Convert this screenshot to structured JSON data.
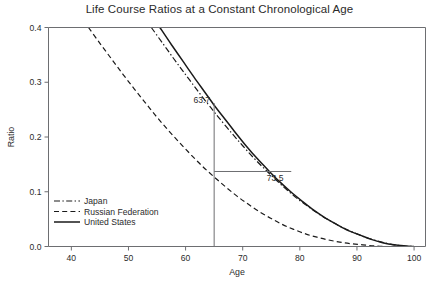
{
  "chart_data": {
    "type": "line",
    "title": "Life Course Ratios at a Constant Chronological Age",
    "xlabel": "Age",
    "ylabel": "Ratio",
    "xlim": [
      36,
      102
    ],
    "ylim": [
      0.0,
      0.4
    ],
    "xticks": [
      40,
      50,
      60,
      70,
      80,
      90,
      100
    ],
    "xticklabels": [
      "40",
      "50",
      "60",
      "70",
      "80",
      "90",
      "100"
    ],
    "yticks": [
      0.0,
      0.1,
      0.2,
      0.3,
      0.4
    ],
    "yticklabels": [
      "0.0",
      "0.1",
      "0.2",
      "0.3",
      "0.4"
    ],
    "grid": false,
    "legend_position": "lower left",
    "series": [
      {
        "name": "Japan",
        "style": "dashdot",
        "x": [
          54.0,
          56.0,
          58.0,
          60.0,
          62.0,
          64.0,
          65.0,
          66.0,
          68.0,
          70.0,
          72.0,
          74.0,
          76.0,
          78.0,
          80.0,
          82.0,
          84.0,
          86.0,
          88.0,
          90.0,
          92.0,
          94.0,
          96.0,
          98.0,
          100.0
        ],
        "y": [
          0.4,
          0.371,
          0.342,
          0.314,
          0.286,
          0.259,
          0.246,
          0.233,
          0.208,
          0.184,
          0.161,
          0.14,
          0.12,
          0.101,
          0.084,
          0.069,
          0.055,
          0.043,
          0.032,
          0.023,
          0.015,
          0.009,
          0.004,
          0.001,
          0.0
        ]
      },
      {
        "name": "Russian Federation",
        "style": "dashed",
        "x": [
          43.0,
          45.0,
          47.0,
          49.0,
          51.0,
          53.0,
          55.0,
          57.0,
          59.0,
          61.0,
          63.0,
          65.0,
          67.0,
          69.0,
          71.0,
          73.0,
          75.0,
          77.0,
          79.0,
          81.0,
          83.0,
          85.0,
          87.0,
          89.0,
          91.0,
          93.0,
          95.0,
          97.0,
          100.0
        ],
        "y": [
          0.4,
          0.371,
          0.343,
          0.315,
          0.288,
          0.262,
          0.236,
          0.212,
          0.189,
          0.167,
          0.146,
          0.127,
          0.109,
          0.092,
          0.077,
          0.063,
          0.051,
          0.04,
          0.031,
          0.023,
          0.017,
          0.012,
          0.008,
          0.005,
          0.003,
          0.001,
          0.0,
          0.0,
          0.0
        ]
      },
      {
        "name": "United States",
        "style": "solid",
        "x": [
          55.5,
          57.5,
          59.5,
          61.5,
          63.5,
          65.0,
          66.5,
          68.5,
          70.5,
          72.5,
          74.5,
          76.5,
          78.5,
          80.5,
          82.5,
          84.5,
          86.5,
          88.5,
          90.5,
          92.5,
          94.5,
          96.5,
          98.5,
          100.0
        ],
        "y": [
          0.4,
          0.369,
          0.339,
          0.309,
          0.28,
          0.258,
          0.238,
          0.211,
          0.185,
          0.161,
          0.139,
          0.118,
          0.099,
          0.082,
          0.066,
          0.052,
          0.04,
          0.029,
          0.021,
          0.013,
          0.007,
          0.003,
          0.001,
          0.0
        ]
      }
    ],
    "annotations": [
      {
        "label": "63.7",
        "value_x": 65,
        "value_y": 0.258,
        "kind": "vertical-reference-top"
      },
      {
        "label": "73.5",
        "value_x": 65,
        "value_y": 0.137,
        "kind": "horizontal-reference"
      }
    ],
    "annotation_guides": {
      "vertical_at_age": 65,
      "vertical_top_ratio": 0.262,
      "vertical_bottom_ratio": 0.0,
      "horizontal_at_ratio": 0.137,
      "horizontal_to_age": 78.5
    }
  },
  "legend": {
    "items": [
      {
        "label": "Japan",
        "style": "dashdot"
      },
      {
        "label": "Russian Federation",
        "style": "dashed"
      },
      {
        "label": "United States",
        "style": "solid"
      }
    ]
  },
  "footer": {
    "caption": ""
  }
}
